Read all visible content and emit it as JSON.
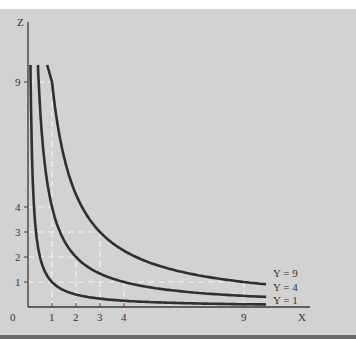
{
  "chart_data": {
    "type": "line",
    "title": "",
    "xlabel": "X",
    "ylabel": "Z",
    "relation": "Z = Y / X",
    "x_ticks": [
      0,
      1,
      2,
      3,
      4,
      9
    ],
    "y_ticks": [
      1,
      2,
      3,
      4,
      9
    ],
    "xlim": [
      0,
      10.3
    ],
    "ylim": [
      0,
      9.9
    ],
    "grid": false,
    "series": [
      {
        "name": "Y = 1",
        "Y": 1,
        "points": [
          [
            0.1,
            10
          ],
          [
            0.25,
            4
          ],
          [
            0.5,
            2
          ],
          [
            1,
            1
          ],
          [
            2,
            0.5
          ],
          [
            3,
            0.33
          ],
          [
            4,
            0.25
          ],
          [
            9,
            0.11
          ],
          [
            9.9,
            0.1
          ]
        ]
      },
      {
        "name": "Y = 4",
        "Y": 4,
        "points": [
          [
            0.41,
            9.7
          ],
          [
            1,
            4
          ],
          [
            2,
            2
          ],
          [
            3,
            1.33
          ],
          [
            4,
            1
          ],
          [
            9,
            0.44
          ],
          [
            9.9,
            0.4
          ]
        ]
      },
      {
        "name": "Y = 9",
        "Y": 9,
        "points": [
          [
            0.8,
            9.7
          ],
          [
            1,
            9
          ],
          [
            3,
            3
          ],
          [
            4,
            2.25
          ],
          [
            9,
            1
          ],
          [
            9.9,
            0.91
          ]
        ]
      }
    ],
    "guides": [
      {
        "from": [
          0,
          9
        ],
        "to": [
          1,
          9
        ]
      },
      {
        "from": [
          0,
          4
        ],
        "to": [
          1,
          4
        ]
      },
      {
        "from": [
          0,
          3
        ],
        "to": [
          3,
          3
        ]
      },
      {
        "from": [
          0,
          2
        ],
        "to": [
          2,
          2
        ]
      },
      {
        "from": [
          0,
          1
        ],
        "to": [
          9,
          1
        ]
      },
      {
        "from": [
          1,
          0
        ],
        "to": [
          1,
          9
        ]
      },
      {
        "from": [
          2,
          0
        ],
        "to": [
          2,
          2
        ]
      },
      {
        "from": [
          3,
          0
        ],
        "to": [
          3,
          3
        ]
      },
      {
        "from": [
          4,
          0
        ],
        "to": [
          4,
          1
        ]
      },
      {
        "from": [
          9,
          0
        ],
        "to": [
          9,
          1
        ]
      }
    ],
    "legend": [
      "Y = 9",
      "Y = 4",
      "Y = 1"
    ],
    "legend_position": "right end of curves"
  },
  "labels": {
    "x_axis": "X",
    "y_axis": "Z",
    "origin": "0",
    "legend_y9": "Y = 9",
    "legend_y4": "Y = 4",
    "legend_y1": "Y = 1"
  }
}
